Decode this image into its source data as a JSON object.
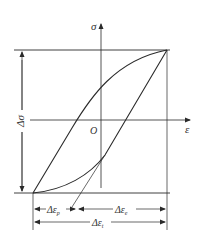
{
  "diagram": {
    "axes": {
      "y_label": "σ",
      "x_label": "ε",
      "origin_label": "O"
    },
    "dimensions": {
      "stress_range": "Δσ",
      "plastic_strain": "Δε",
      "plastic_strain_sub": "p",
      "elastic_strain": "Δε",
      "elastic_strain_sub": "e",
      "total_strain": "Δε",
      "total_strain_sub": "t"
    },
    "colors": {
      "line": "#2a2a2a",
      "background": "#ffffff"
    }
  }
}
